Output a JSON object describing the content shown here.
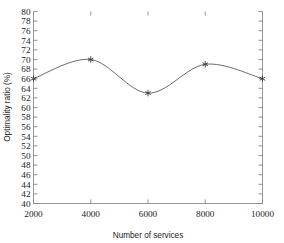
{
  "chart_data": {
    "type": "line",
    "title": "",
    "subtitle": "",
    "xlabel": "Number of services",
    "ylabel": "Optimality ratio (%)",
    "x": [
      2000,
      4000,
      6000,
      8000,
      10000
    ],
    "values": [
      66,
      70,
      63,
      69,
      66
    ],
    "series": [
      {
        "name": "",
        "values": [
          66,
          70,
          63,
          69,
          66
        ]
      }
    ],
    "xlim": [
      2000,
      10000
    ],
    "ylim": [
      40,
      80
    ],
    "xticks": [
      2000,
      4000,
      6000,
      8000,
      10000
    ],
    "xtick_labels": [
      "2000",
      "4000",
      "6000",
      "8000",
      "10000"
    ],
    "yticks": [
      40,
      42,
      44,
      46,
      48,
      50,
      52,
      54,
      56,
      58,
      60,
      62,
      64,
      66,
      68,
      70,
      72,
      74,
      76,
      78,
      80
    ],
    "ytick_labels": [
      "40",
      "42",
      "44",
      "46",
      "48",
      "50",
      "52",
      "54",
      "56",
      "58",
      "60",
      "62",
      "64",
      "66",
      "68",
      "70",
      "72",
      "74",
      "76",
      "78",
      "80"
    ],
    "grid": false,
    "legend": false,
    "legend_position": "none",
    "marker": "star",
    "line_color": "#5a5a5a",
    "marker_color": "#3a3a3a",
    "background_color": "#ffffff",
    "axis_color": "#8a8a8a",
    "smoothing": "spline"
  },
  "axes": {
    "x_title": "Number of services",
    "y_title": "Optimality ratio (%)"
  }
}
